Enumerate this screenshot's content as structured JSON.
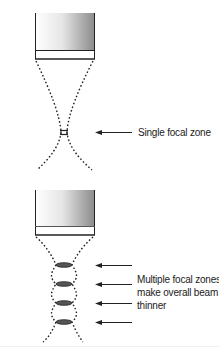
{
  "diagram": {
    "top_panel": {
      "label": "Single focal zone",
      "focal_zone_count": 1
    },
    "bottom_panel": {
      "label_lines": [
        "Multiple focal zones",
        "make overall beam",
        "thinner"
      ],
      "focal_zone_count": 4
    },
    "colors": {
      "line": "#222222",
      "transducer_gradient_start": "#ffffff",
      "transducer_gradient_end": "#8a8a8a",
      "focal_zone_fill": "#555555"
    }
  }
}
